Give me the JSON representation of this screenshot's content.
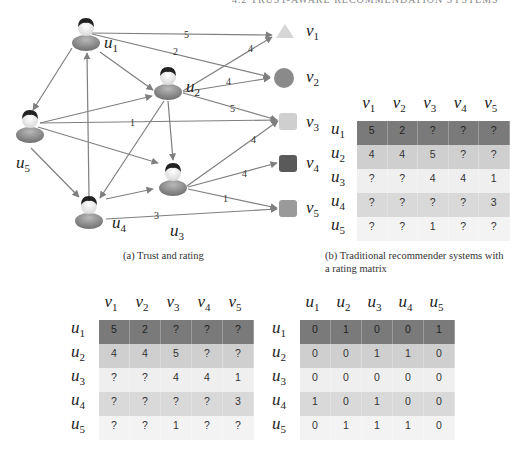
{
  "header": {
    "text": "4.2 TRUST-AWARE RECOMMENDATION SYSTEMS"
  },
  "graph": {
    "users": [
      {
        "id": "u1",
        "label": "u",
        "sub": "1"
      },
      {
        "id": "u2",
        "label": "u",
        "sub": "2"
      },
      {
        "id": "u3",
        "label": "u",
        "sub": "3"
      },
      {
        "id": "u4",
        "label": "u",
        "sub": "4"
      },
      {
        "id": "u5",
        "label": "u",
        "sub": "5"
      }
    ],
    "items": [
      {
        "id": "v1",
        "label": "v",
        "sub": "1",
        "shape": "triangle",
        "color": "#d6d6d6"
      },
      {
        "id": "v2",
        "label": "v",
        "sub": "2",
        "shape": "circle",
        "color": "#8a8a8a"
      },
      {
        "id": "v3",
        "label": "v",
        "sub": "3",
        "shape": "square",
        "color": "#cfcfcf"
      },
      {
        "id": "v4",
        "label": "v",
        "sub": "4",
        "shape": "square",
        "color": "#5a5a5a"
      },
      {
        "id": "v5",
        "label": "v",
        "sub": "5",
        "shape": "square",
        "color": "#9a9a9a"
      }
    ],
    "rating_edges": [
      {
        "from": "u1",
        "to": "v1",
        "rating": "5"
      },
      {
        "from": "u1",
        "to": "v2",
        "rating": "2"
      },
      {
        "from": "u2",
        "to": "v1",
        "rating": "4"
      },
      {
        "from": "u2",
        "to": "v2",
        "rating": "4"
      },
      {
        "from": "u2",
        "to": "v3",
        "rating": "5"
      },
      {
        "from": "u3",
        "to": "v3",
        "rating": "4"
      },
      {
        "from": "u3",
        "to": "v4",
        "rating": "4"
      },
      {
        "from": "u3",
        "to": "v5",
        "rating": "1"
      },
      {
        "from": "u4",
        "to": "v5",
        "rating": "3"
      },
      {
        "from": "u5",
        "to": "v3",
        "rating": "1"
      }
    ],
    "trust_edges": [
      {
        "from": "u1",
        "to": "u2"
      },
      {
        "from": "u1",
        "to": "u5"
      },
      {
        "from": "u2",
        "to": "u3"
      },
      {
        "from": "u2",
        "to": "u4"
      },
      {
        "from": "u4",
        "to": "u1"
      },
      {
        "from": "u4",
        "to": "u3"
      },
      {
        "from": "u5",
        "to": "u2"
      },
      {
        "from": "u5",
        "to": "u3"
      },
      {
        "from": "u5",
        "to": "u4"
      }
    ]
  },
  "captions": {
    "a": "(a)  Trust and rating",
    "b_line1": "(b)  Traditional recommender systems with",
    "b_line2": "a rating matrix"
  },
  "matrices": {
    "rating_top": {
      "col_headers": [
        "1",
        "2",
        "3",
        "4",
        "5"
      ],
      "col_prefix": "v",
      "row_headers": [
        "1",
        "2",
        "3",
        "4",
        "5"
      ],
      "row_prefix": "u",
      "rows": [
        [
          "5",
          "2",
          "?",
          "?",
          "?"
        ],
        [
          "4",
          "4",
          "5",
          "?",
          "?"
        ],
        [
          "?",
          "?",
          "4",
          "4",
          "1"
        ],
        [
          "?",
          "?",
          "?",
          "?",
          "3"
        ],
        [
          "?",
          "?",
          "1",
          "?",
          "?"
        ]
      ]
    },
    "rating_bottom": {
      "col_headers": [
        "1",
        "2",
        "3",
        "4",
        "5"
      ],
      "col_prefix": "v",
      "row_headers": [
        "1",
        "2",
        "3",
        "4",
        "5"
      ],
      "row_prefix": "u",
      "rows": [
        [
          "5",
          "2",
          "?",
          "?",
          "?"
        ],
        [
          "4",
          "4",
          "5",
          "?",
          "?"
        ],
        [
          "?",
          "?",
          "4",
          "4",
          "1"
        ],
        [
          "?",
          "?",
          "?",
          "?",
          "3"
        ],
        [
          "?",
          "?",
          "1",
          "?",
          "?"
        ]
      ]
    },
    "trust_bottom": {
      "col_headers": [
        "1",
        "2",
        "3",
        "4",
        "5"
      ],
      "col_prefix": "u",
      "row_headers": [
        "1",
        "2",
        "3",
        "4",
        "5"
      ],
      "row_prefix": "u",
      "rows": [
        [
          "0",
          "1",
          "0",
          "0",
          "1"
        ],
        [
          "0",
          "0",
          "1",
          "1",
          "0"
        ],
        [
          "0",
          "0",
          "0",
          "0",
          "0"
        ],
        [
          "1",
          "0",
          "1",
          "0",
          "0"
        ],
        [
          "0",
          "1",
          "1",
          "1",
          "0"
        ]
      ]
    }
  },
  "colors": {
    "row_bg": [
      "#7a7a7a",
      "#cfcfcf",
      "#efefef",
      "#d9d9d9",
      "#f3f3f3"
    ],
    "edge": "#7f7f7f"
  }
}
